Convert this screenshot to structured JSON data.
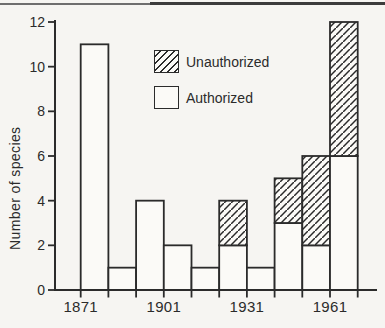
{
  "chart_data": {
    "type": "bar",
    "stacked": true,
    "title": "",
    "xlabel": "",
    "ylabel": "Number of species",
    "ylim": [
      0,
      12
    ],
    "yticks": [
      0,
      2,
      4,
      6,
      8,
      10,
      12
    ],
    "x_axis_years": [
      1871,
      1881,
      1891,
      1901,
      1911,
      1921,
      1931,
      1941,
      1951,
      1961,
      1971
    ],
    "x_tick_labels": [
      "1871",
      "1901",
      "1931",
      "1961"
    ],
    "bin_start_years": [
      1871,
      1881,
      1891,
      1901,
      1911,
      1921,
      1931,
      1941,
      1951,
      1961
    ],
    "bin_width_years": 10,
    "series": [
      {
        "name": "Authorized",
        "pattern": "open",
        "values": [
          11,
          1,
          4,
          2,
          1,
          2,
          1,
          3,
          2,
          6
        ]
      },
      {
        "name": "Unauthorized",
        "pattern": "hatched",
        "values": [
          0,
          0,
          0,
          0,
          0,
          2,
          0,
          2,
          4,
          6
        ]
      }
    ],
    "bin_totals": [
      11,
      1,
      4,
      2,
      1,
      4,
      1,
      5,
      6,
      12
    ],
    "legend": {
      "position": "upper-left-of-plot",
      "entries": [
        {
          "label": "Unauthorized",
          "pattern": "hatched"
        },
        {
          "label": "Authorized",
          "pattern": "open"
        }
      ]
    },
    "grid": false,
    "colors": {
      "ink": "#2b2b2b",
      "bar_fill": "#fbfaf7",
      "background": "#f6f5f2"
    }
  }
}
